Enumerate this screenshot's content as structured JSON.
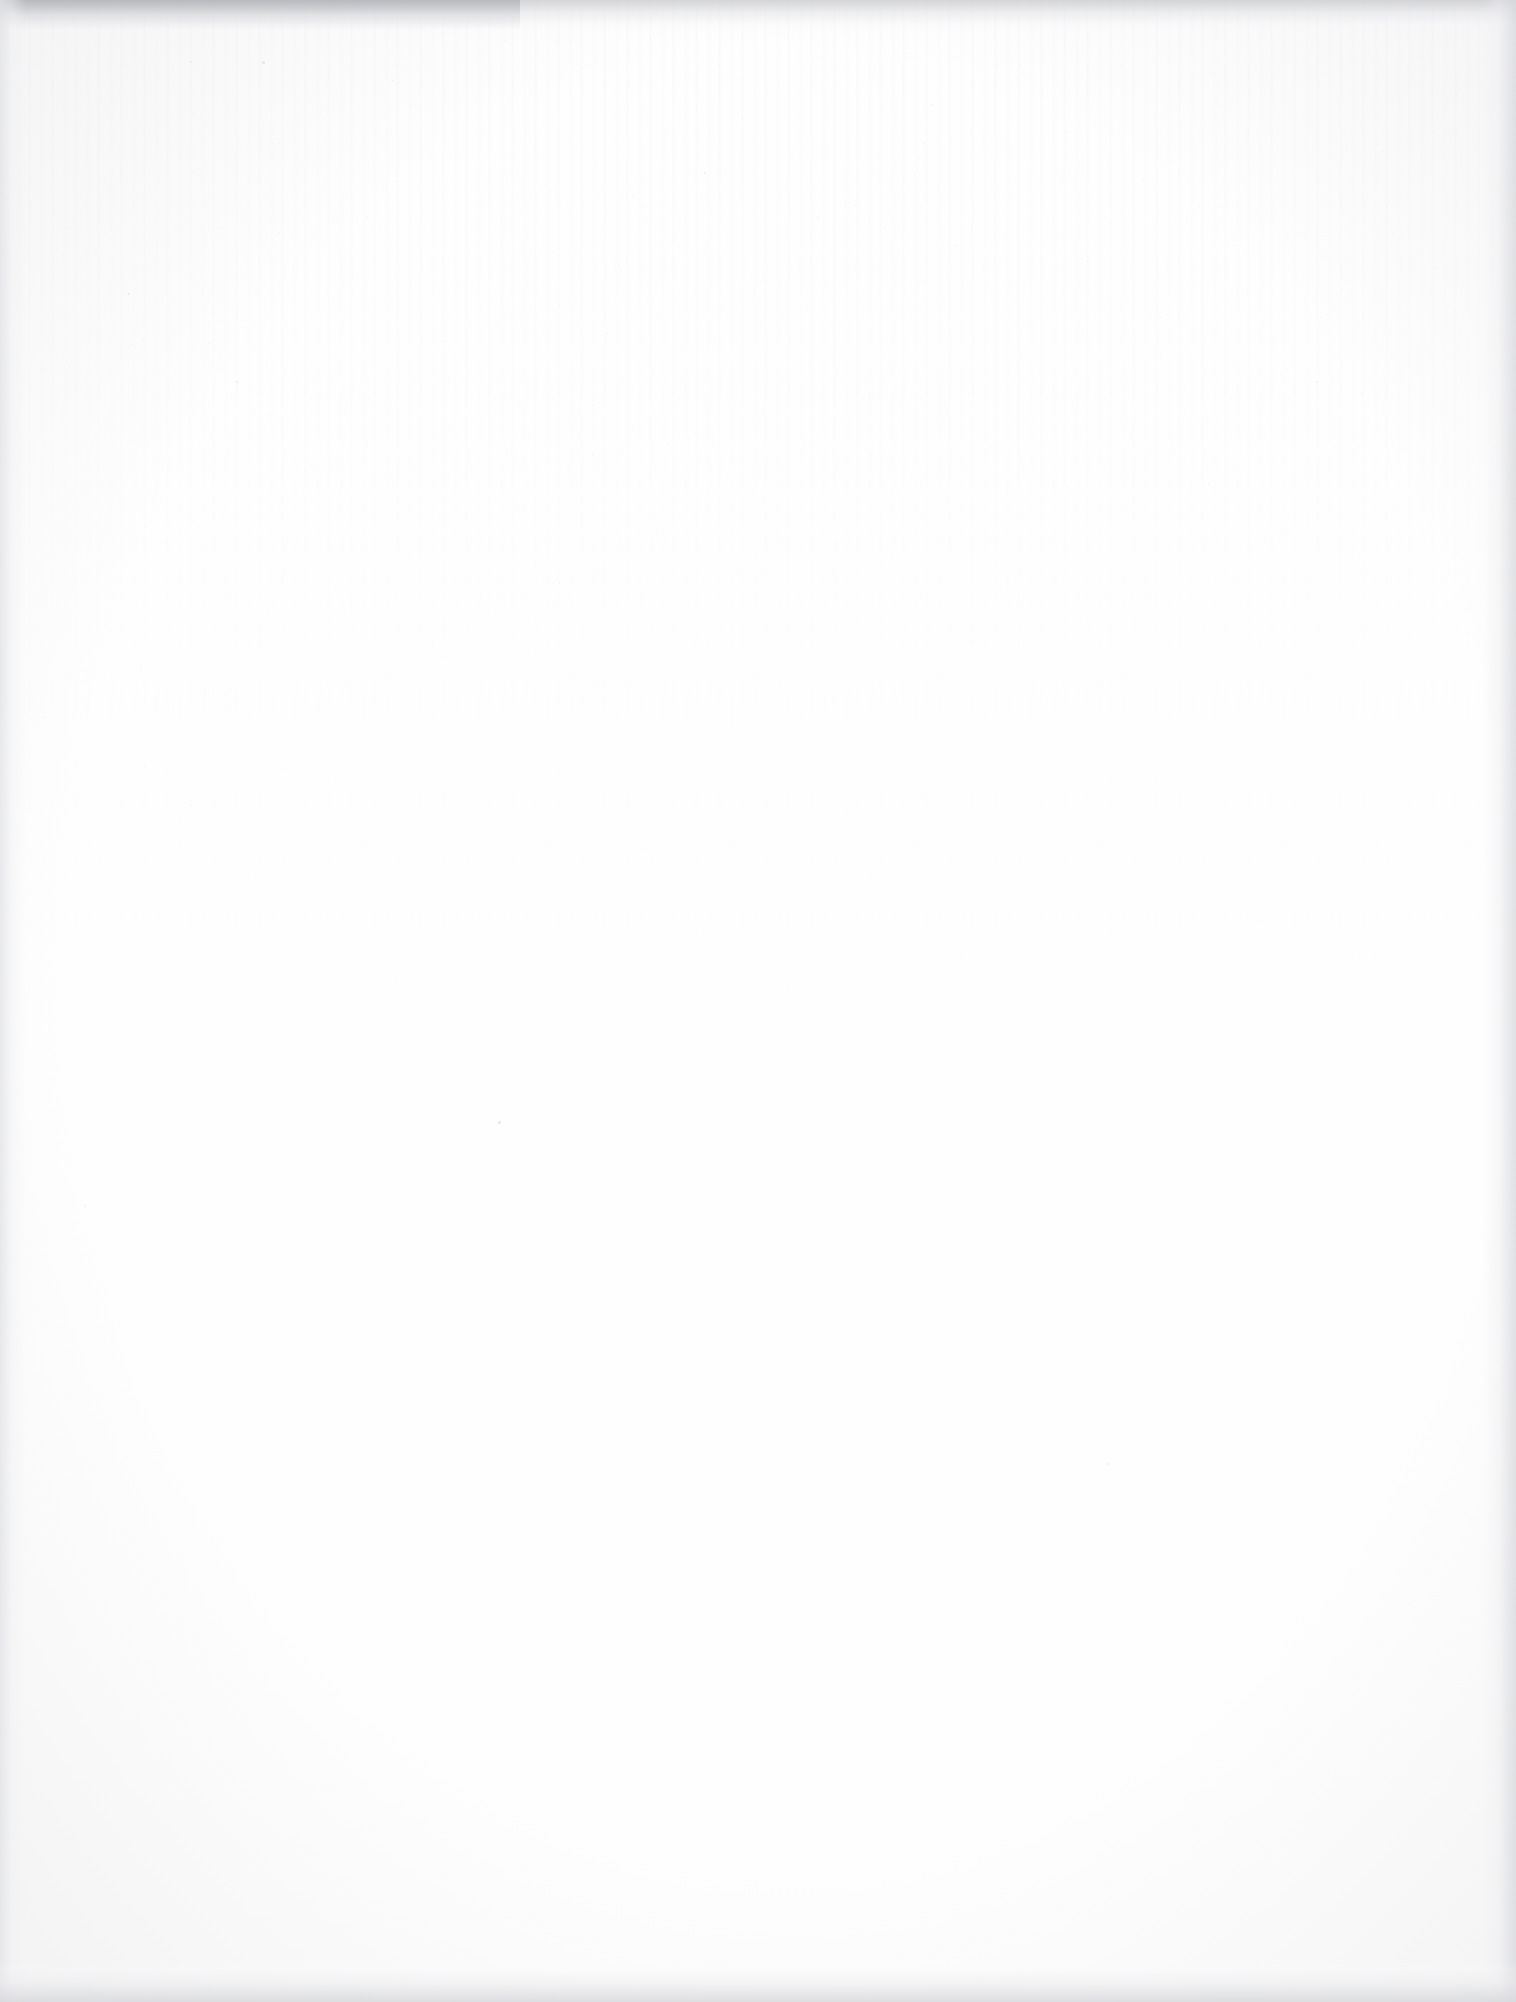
{
  "document": {
    "kind": "scanned-page",
    "page_content": "",
    "visible_text": "",
    "description": "Blank scanned document page with no printed text, headings, figures or page number visible.",
    "page_width_px": 1516,
    "page_height_px": 2002,
    "orientation": "portrait"
  },
  "appearance": {
    "paper_color": "#fefefe",
    "base_white": "#ffffff",
    "edge_shadow_color": "#d6d7db",
    "top_edge_dark_color": "#b2b3b8",
    "speckle_color": "#c9c9cd",
    "streak_color": "#eeeef1"
  },
  "artifacts": {
    "speckle_noise": "Fine gray dust speckle, densest in the upper-left quadrant, fading toward the page centre and right side.",
    "vertical_streaking": "Faint vertical scanner streaks across the upper portion of the page.",
    "edge_vignette": "Subtle gray darkening along the top, left, right and bottom edges of the scan.",
    "dust_marks": [
      {
        "x": 262,
        "y": 61,
        "size": 3
      },
      {
        "x": 128,
        "y": 293,
        "size": 2
      },
      {
        "x": 375,
        "y": 18,
        "size": 2
      },
      {
        "x": 498,
        "y": 1121,
        "size": 3
      },
      {
        "x": 236,
        "y": 381,
        "size": 2
      },
      {
        "x": 704,
        "y": 172,
        "size": 2
      },
      {
        "x": 190,
        "y": 61,
        "size": 2
      },
      {
        "x": 1107,
        "y": 1463,
        "size": 2
      },
      {
        "x": 84,
        "y": 1205,
        "size": 2
      },
      {
        "x": 1316,
        "y": 381,
        "size": 2
      }
    ]
  }
}
